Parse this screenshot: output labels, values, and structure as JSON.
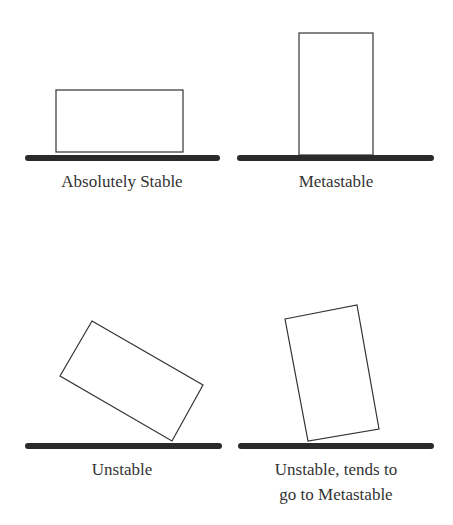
{
  "panels": [
    {
      "id": "absolutely-stable",
      "label": "Absolutely Stable"
    },
    {
      "id": "metastable",
      "label": "Metastable"
    },
    {
      "id": "unstable",
      "label": "Unstable"
    },
    {
      "id": "unstable-to-metastable",
      "label_line1": "Unstable, tends to",
      "label_line2": "go to Metastable"
    }
  ],
  "colors": {
    "ground": "#2a2a2a",
    "block_stroke": "#333333",
    "text": "#333333"
  }
}
